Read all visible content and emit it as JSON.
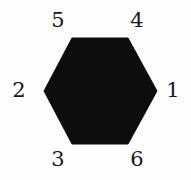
{
  "figure": {
    "kind": "hexagon-face-numbering-diagram",
    "background_color": "#fdfdfd"
  },
  "shape": {
    "name": "hexagon",
    "orientation": "flat-top",
    "fill_color": "#0d0d0d",
    "stroke_color": "#0d0d0d",
    "vertices": [
      {
        "x": 72,
        "y": 38
      },
      {
        "x": 128,
        "y": 38
      },
      {
        "x": 157,
        "y": 91
      },
      {
        "x": 128,
        "y": 144
      },
      {
        "x": 72,
        "y": 144
      },
      {
        "x": 44,
        "y": 91
      }
    ],
    "center": {
      "x": 100,
      "y": 91
    }
  },
  "labels": {
    "color": "#17171a",
    "items": [
      {
        "id": "1",
        "text": "1",
        "position": "right",
        "x": 173,
        "y": 90
      },
      {
        "id": "2",
        "text": "2",
        "position": "left",
        "x": 19,
        "y": 90
      },
      {
        "id": "3",
        "text": "3",
        "position": "bottom-left",
        "x": 58,
        "y": 159
      },
      {
        "id": "4",
        "text": "4",
        "position": "top-right",
        "x": 137,
        "y": 20
      },
      {
        "id": "5",
        "text": "5",
        "position": "top-left",
        "x": 58,
        "y": 20
      },
      {
        "id": "6",
        "text": "6",
        "position": "bottom-right",
        "x": 137,
        "y": 159
      }
    ]
  }
}
